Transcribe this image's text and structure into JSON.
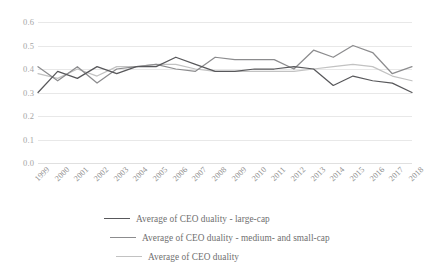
{
  "chart_data": {
    "type": "line",
    "title": "",
    "xlabel": "",
    "ylabel": "",
    "grid": true,
    "legend_position": "bottom",
    "ylim": [
      0.0,
      0.6
    ],
    "yticks": [
      "0.0",
      "0.1",
      "0.2",
      "0.3",
      "0.4",
      "0.5",
      "0.6"
    ],
    "ytick_values": [
      0.0,
      0.1,
      0.2,
      0.3,
      0.4,
      0.5,
      0.6
    ],
    "categories": [
      "1999",
      "2000",
      "2001",
      "2002",
      "2003",
      "2004",
      "2005",
      "2006",
      "2007",
      "2008",
      "2009",
      "2010",
      "2011",
      "2012",
      "2013",
      "2014",
      "2015",
      "2016",
      "2017",
      "2018"
    ],
    "series": [
      {
        "name": "Average of CEO duality - large-cap",
        "color": "#58585b",
        "values": [
          0.3,
          0.39,
          0.36,
          0.41,
          0.38,
          0.41,
          0.41,
          0.45,
          0.42,
          0.39,
          0.39,
          0.4,
          0.4,
          0.41,
          0.4,
          0.33,
          0.37,
          0.35,
          0.34,
          0.3
        ]
      },
      {
        "name": "Average of CEO duality - medium- and small-cap",
        "color": "#8c8c8e",
        "values": [
          0.41,
          0.35,
          0.41,
          0.34,
          0.4,
          0.41,
          0.42,
          0.4,
          0.39,
          0.45,
          0.44,
          0.44,
          0.44,
          0.4,
          0.48,
          0.45,
          0.5,
          0.47,
          0.38,
          0.41
        ]
      },
      {
        "name": "Average of CEO duality",
        "color": "#c2c2c2",
        "values": [
          0.38,
          0.36,
          0.4,
          0.37,
          0.41,
          0.41,
          0.42,
          0.42,
          0.4,
          0.39,
          0.39,
          0.39,
          0.39,
          0.39,
          0.4,
          0.41,
          0.42,
          0.41,
          0.37,
          0.35
        ]
      }
    ]
  },
  "legend": {
    "items": [
      {
        "label": "Average of CEO duality - large-cap"
      },
      {
        "label": "Average of CEO duality - medium- and small-cap"
      },
      {
        "label": "Average of CEO duality"
      }
    ]
  }
}
